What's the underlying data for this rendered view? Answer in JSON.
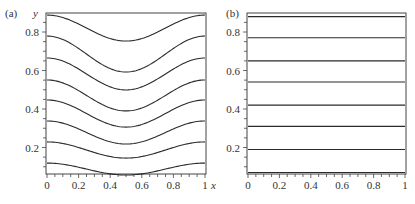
{
  "chart_data": [
    {
      "type": "line",
      "panel_label": "(a)",
      "title": "",
      "xlabel": "x",
      "ylabel": "y",
      "xlim": [
        0,
        1
      ],
      "ylim": [
        0.06,
        0.9
      ],
      "xticks": [
        "0",
        "0.2",
        "0.4",
        "0.6",
        "0.8",
        "1"
      ],
      "yticks": [
        "0.2",
        "0.4",
        "0.6",
        "0.8"
      ],
      "grid": false,
      "legend": null,
      "description": "Eight contour curves, symmetric about x=0.5 with minimum at x=0.5",
      "x": [
        0,
        0.1,
        0.2,
        0.3,
        0.4,
        0.5,
        0.6,
        0.7,
        0.8,
        0.9,
        1.0
      ],
      "series": [
        {
          "name": "contour-1",
          "edge": 0.888,
          "mid": 0.753,
          "values": [
            0.888,
            0.875,
            0.84,
            0.794,
            0.766,
            0.753,
            0.766,
            0.794,
            0.84,
            0.875,
            0.888
          ]
        },
        {
          "name": "contour-2",
          "edge": 0.779,
          "mid": 0.592,
          "values": [
            0.779,
            0.761,
            0.713,
            0.649,
            0.61,
            0.592,
            0.61,
            0.649,
            0.713,
            0.761,
            0.779
          ]
        },
        {
          "name": "contour-3",
          "edge": 0.665,
          "mid": 0.499,
          "values": [
            0.665,
            0.649,
            0.606,
            0.55,
            0.515,
            0.499,
            0.515,
            0.55,
            0.606,
            0.649,
            0.665
          ]
        },
        {
          "name": "contour-4",
          "edge": 0.551,
          "mid": 0.39,
          "values": [
            0.551,
            0.536,
            0.494,
            0.44,
            0.405,
            0.39,
            0.405,
            0.44,
            0.494,
            0.536,
            0.551
          ]
        },
        {
          "name": "contour-5",
          "edge": 0.447,
          "mid": 0.306,
          "values": [
            0.447,
            0.434,
            0.397,
            0.35,
            0.319,
            0.306,
            0.319,
            0.35,
            0.397,
            0.434,
            0.447
          ]
        },
        {
          "name": "contour-6",
          "edge": 0.338,
          "mid": 0.218,
          "values": [
            0.338,
            0.327,
            0.295,
            0.255,
            0.229,
            0.218,
            0.229,
            0.255,
            0.295,
            0.327,
            0.338
          ]
        },
        {
          "name": "contour-7",
          "edge": 0.229,
          "mid": 0.145,
          "values": [
            0.229,
            0.221,
            0.199,
            0.171,
            0.153,
            0.145,
            0.153,
            0.171,
            0.199,
            0.221,
            0.229
          ]
        },
        {
          "name": "contour-8",
          "edge": 0.119,
          "mid": 0.057,
          "values": [
            0.119,
            0.113,
            0.097,
            0.076,
            0.063,
            0.057,
            0.063,
            0.076,
            0.097,
            0.113,
            0.119
          ]
        }
      ]
    },
    {
      "type": "line",
      "panel_label": "(b)",
      "title": "",
      "xlabel": "",
      "ylabel": "",
      "xlim": [
        0,
        1
      ],
      "ylim": [
        0.06,
        0.9
      ],
      "xticks": [
        "0",
        "0.2",
        "0.4",
        "0.6",
        "0.8",
        "1"
      ],
      "yticks": [
        "0.2",
        "0.4",
        "0.6",
        "0.8"
      ],
      "grid": false,
      "legend": null,
      "description": "Eight horizontal (flat) contour lines",
      "x": [
        0,
        1
      ],
      "series": [
        {
          "name": "contour-1",
          "edge": 0.88,
          "mid": 0.88,
          "values": [
            0.88,
            0.88
          ]
        },
        {
          "name": "contour-2",
          "edge": 0.77,
          "mid": 0.77,
          "values": [
            0.77,
            0.77
          ]
        },
        {
          "name": "contour-3",
          "edge": 0.65,
          "mid": 0.65,
          "values": [
            0.65,
            0.65
          ]
        },
        {
          "name": "contour-4",
          "edge": 0.54,
          "mid": 0.54,
          "values": [
            0.54,
            0.54
          ]
        },
        {
          "name": "contour-5",
          "edge": 0.42,
          "mid": 0.42,
          "values": [
            0.42,
            0.42
          ]
        },
        {
          "name": "contour-6",
          "edge": 0.31,
          "mid": 0.31,
          "values": [
            0.31,
            0.31
          ]
        },
        {
          "name": "contour-7",
          "edge": 0.19,
          "mid": 0.19,
          "values": [
            0.19,
            0.19
          ]
        },
        {
          "name": "contour-8",
          "edge": 0.07,
          "mid": 0.07,
          "values": [
            0.07,
            0.07
          ]
        }
      ]
    }
  ],
  "layout": {
    "panels": [
      {
        "x0": 47,
        "x1": 205,
        "top": 13,
        "bottom": 174,
        "px_per_unit_y": 192.5,
        "y_zero_px": 186
      },
      {
        "x0": 248,
        "x1": 405,
        "top": 13,
        "bottom": 174,
        "px_per_unit_y": 192.5,
        "y_zero_px": 186
      }
    ],
    "line_color": "#2a2a2a",
    "axis_color": "#444444"
  }
}
